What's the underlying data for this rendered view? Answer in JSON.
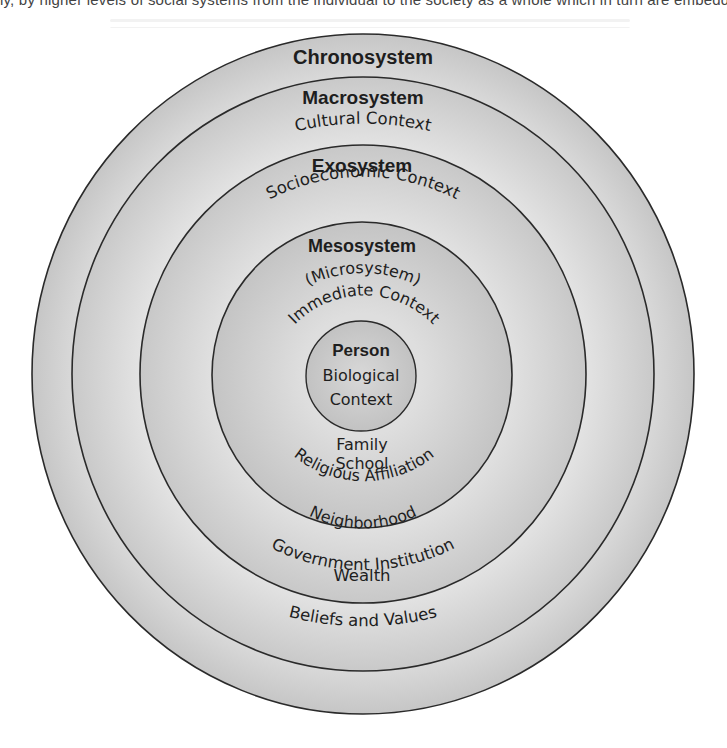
{
  "diagram": {
    "top_cutoff_text": "ly, by higher levels of social systems from the individual to the society as a whole which in turn are embedded in the chronosystem",
    "layers": [
      {
        "id": "chronosystem",
        "name": "Chronosystem",
        "context": "",
        "items": [],
        "fill_inner": "#e4e4e4",
        "fill_outer": "#c6c6c6"
      },
      {
        "id": "macrosystem",
        "name": "Macrosystem",
        "context": "Cultural Context",
        "items": [
          "Beliefs and Values"
        ],
        "fill_inner": "#e6e6e6",
        "fill_outer": "#c9c9c9"
      },
      {
        "id": "exosystem",
        "name": "Exosystem",
        "context": "Socioeconomic Context",
        "items": [
          "Government Institution",
          "Wealth"
        ],
        "fill_inner": "#e2e2e2",
        "fill_outer": "#c8c8c8"
      },
      {
        "id": "mesosystem",
        "name": "Mesosystem",
        "subname": "(Microsystem)",
        "context": "Immediate Context",
        "items": [
          "Family",
          "School",
          "Religious Affiliation",
          "Neighborhood"
        ],
        "fill_inner": "#dcdcdc",
        "fill_outer": "#c4c4c4"
      },
      {
        "id": "person",
        "name": "Person",
        "context_line1": "Biological",
        "context_line2": "Context",
        "fill_inner": "#d4d4d4",
        "fill_outer": "#c0c0c0"
      }
    ],
    "stroke_color": "#2a2a2a",
    "text_color": "#1e1e1e"
  }
}
